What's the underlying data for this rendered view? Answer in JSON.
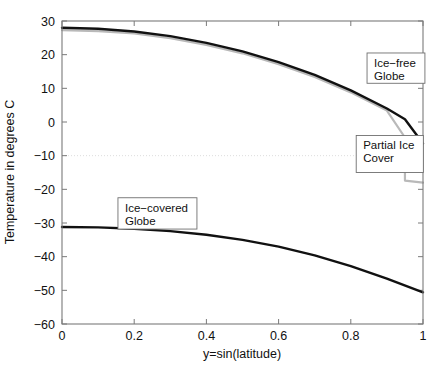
{
  "chart_data": {
    "type": "line",
    "title": "",
    "xlabel": "y=sin(latitude)",
    "ylabel": "Temperature in degrees C",
    "xlim": [
      0,
      1
    ],
    "ylim": [
      -60,
      30
    ],
    "xticks": [
      "0",
      "0.2",
      "0.4",
      "0.6",
      "0.8",
      "1"
    ],
    "xtick_values": [
      0,
      0.2,
      0.4,
      0.6,
      0.8,
      1
    ],
    "yticks": [
      "30",
      "20",
      "10",
      "0",
      "-10",
      "-20",
      "-30",
      "-40",
      "-50",
      "-60"
    ],
    "ytick_values": [
      30,
      20,
      10,
      0,
      -10,
      -20,
      -30,
      -40,
      -50,
      -60
    ],
    "grid": "horizontal line at -10 only",
    "gridline_values": [
      -10
    ],
    "legend_position": "inline annotation boxes",
    "series": [
      {
        "name": "Ice-free Globe",
        "color": "#111111",
        "x": [
          0,
          0.1,
          0.2,
          0.3,
          0.4,
          0.5,
          0.6,
          0.7,
          0.8,
          0.9,
          0.95,
          1
        ],
        "values": [
          28.0,
          27.7,
          26.9,
          25.5,
          23.5,
          21.0,
          17.8,
          14.0,
          9.4,
          4.0,
          0.8,
          -6.4
        ]
      },
      {
        "name": "Partial Ice Cover",
        "color": "#b9b9b9",
        "x": [
          0,
          0.1,
          0.2,
          0.3,
          0.4,
          0.5,
          0.6,
          0.7,
          0.8,
          0.9,
          0.95,
          0.95,
          1
        ],
        "values": [
          27.3,
          27.0,
          26.3,
          24.9,
          22.9,
          20.4,
          17.2,
          13.4,
          8.8,
          3.4,
          -4.6,
          -17.4,
          -18.0
        ]
      },
      {
        "name": "Ice-covered Globe",
        "color": "#111111",
        "x": [
          0,
          0.1,
          0.2,
          0.3,
          0.4,
          0.5,
          0.6,
          0.7,
          0.8,
          0.9,
          1
        ],
        "values": [
          -31.2,
          -31.3,
          -31.7,
          -32.4,
          -33.5,
          -35.0,
          -37.0,
          -39.6,
          -42.8,
          -46.5,
          -50.6
        ]
      }
    ],
    "annotations": [
      {
        "id": "ice-free",
        "line1": "Ice−free",
        "line2": "Globe",
        "box_x": 0.845,
        "box_y_top": 20.5,
        "box_y_bottom": 11.5
      },
      {
        "id": "partial-ice",
        "line1": "Partial Ice",
        "line2": "Cover",
        "box_x": 0.815,
        "box_y_top": -4.0,
        "box_y_bottom": -15.0
      },
      {
        "id": "ice-covered",
        "line1": "Ice−covered",
        "line2": "Globe",
        "box_x": 0.155,
        "box_y_top": -22.5,
        "box_y_bottom": -31.8
      }
    ]
  },
  "figure": {
    "background_color": "#ffffff",
    "axis_color": "#7a7a7a",
    "curve_color": "#111111",
    "secondary_curve_color": "#b9b9b9",
    "gridline_color": "#d9d9d9"
  }
}
